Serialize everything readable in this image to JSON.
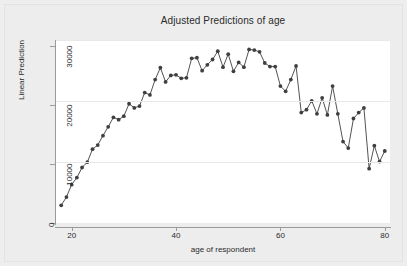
{
  "chart_data": {
    "type": "line",
    "title": "Adjusted Predictions of age",
    "xlabel": "age of respondent",
    "ylabel": "Linear Prediction",
    "xlim": [
      17,
      81
    ],
    "ylim": [
      0,
      31000
    ],
    "xticks": [
      20,
      40,
      60,
      80
    ],
    "xtick_labels": [
      "20",
      "40",
      "60",
      "80"
    ],
    "yticks": [
      0,
      10000,
      20000,
      30000
    ],
    "ytick_labels": [
      "0",
      "10000",
      "20000",
      "30000"
    ],
    "grid": "horizontal",
    "legend": "none",
    "marker": "circle",
    "series_color": "#3f3f3f",
    "series": [
      {
        "name": "Linear Prediction",
        "x": [
          18,
          19,
          20,
          21,
          22,
          23,
          24,
          25,
          26,
          27,
          28,
          29,
          30,
          31,
          32,
          33,
          34,
          35,
          36,
          37,
          38,
          39,
          40,
          41,
          42,
          43,
          44,
          45,
          46,
          47,
          48,
          49,
          50,
          51,
          52,
          53,
          54,
          55,
          56,
          57,
          58,
          59,
          60,
          61,
          62,
          63,
          64,
          65,
          66,
          67,
          68,
          69,
          70,
          71,
          72,
          73,
          74,
          75,
          76,
          77,
          78,
          79,
          80
        ],
        "values": [
          3000,
          4400,
          6500,
          7700,
          9400,
          10300,
          12500,
          13200,
          14800,
          16300,
          17900,
          17500,
          18100,
          20200,
          19500,
          19800,
          22100,
          21700,
          24300,
          26300,
          23900,
          25000,
          25100,
          24500,
          24600,
          27900,
          28000,
          25800,
          26800,
          27700,
          29100,
          26400,
          28600,
          25700,
          27200,
          26400,
          29400,
          29300,
          29000,
          27100,
          26500,
          26500,
          23200,
          22300,
          24300,
          26600,
          18700,
          19200,
          20700,
          18500,
          21200,
          18300,
          23200,
          18500,
          13800,
          12700,
          17700,
          18700,
          19500,
          9200,
          13100,
          10400,
          12200
        ]
      }
    ]
  },
  "axes": {
    "y_tick_positions_px": [
      183,
      122,
      61,
      0
    ],
    "x_tick_positions_px": [
      8,
      116,
      223,
      329
    ]
  }
}
